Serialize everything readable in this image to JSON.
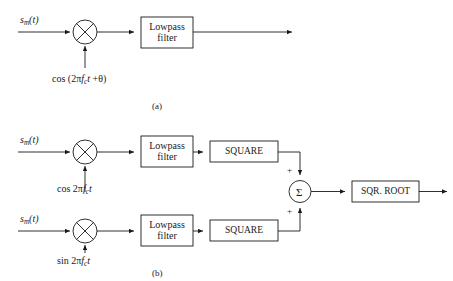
{
  "figure": {
    "type": "block-diagram"
  },
  "captions": {
    "a": "(a)",
    "b": "(b)"
  },
  "part_a": {
    "input_label_s": "s",
    "input_label_sub": "m",
    "input_label_tail": "(t)",
    "multiplier_icon": "multiplier-x-icon",
    "lowpass_line1": "Lowpass",
    "lowpass_line2": "filter",
    "carrier_prefix": "cos (2",
    "carrier_pi": "π",
    "carrier_f": "f",
    "carrier_fsub": "c",
    "carrier_t": "t",
    "carrier_plus": " +",
    "carrier_theta": "θ",
    "carrier_close": ")"
  },
  "part_b": {
    "top_branch": {
      "input_label_s": "s",
      "input_label_sub": "m",
      "input_label_tail": "(t)",
      "multiplier_icon": "multiplier-x-icon",
      "lowpass_line1": "Lowpass",
      "lowpass_line2": "filter",
      "square_label": "SQUARE",
      "carrier_prefix": "cos 2",
      "carrier_pi": "π",
      "carrier_f": "f",
      "carrier_fsub": "c",
      "carrier_t": "t"
    },
    "bottom_branch": {
      "input_label_s": "s",
      "input_label_sub": "m",
      "input_label_tail": "(t)",
      "multiplier_icon": "multiplier-x-icon",
      "lowpass_line1": "Lowpass",
      "lowpass_line2": "filter",
      "square_label": "SQUARE",
      "carrier_prefix": "sin 2",
      "carrier_pi": "π",
      "carrier_f": "f",
      "carrier_fsub": "c",
      "carrier_t": "t"
    },
    "summer": {
      "symbol": "Σ",
      "plus_top": "+",
      "plus_bottom": "+"
    },
    "sqr_root_label": "SQR. ROOT"
  },
  "colors": {
    "line": "#1a1a1a",
    "text": "#1a1a1a",
    "background": "#ffffff"
  }
}
